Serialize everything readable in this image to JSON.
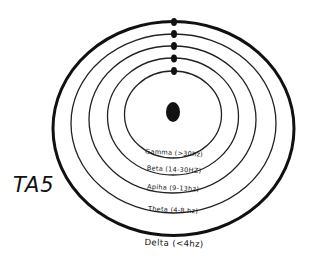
{
  "diagram": {
    "side_label": "TA5",
    "center_marker": "center-dot",
    "rings": [
      {
        "name": "Gamma",
        "label": "Gamma (>30hz)"
      },
      {
        "name": "Beta",
        "label": "Beta (14-30HZ)"
      },
      {
        "name": "Alpha",
        "label": "Apiha (9-13hz)"
      },
      {
        "name": "Theta",
        "label": "Theta (4-8 hz)"
      },
      {
        "name": "Delta",
        "label": "Delta (<4hz)"
      }
    ],
    "colors": {
      "stroke": "#111111",
      "background": "#ffffff"
    }
  }
}
